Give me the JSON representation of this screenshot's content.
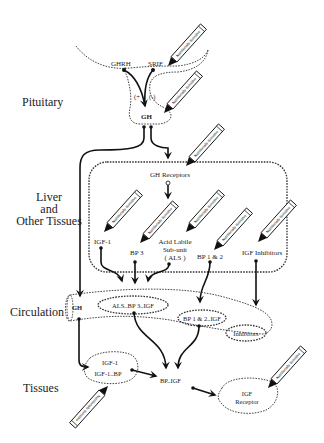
{
  "regions": {
    "pituitary": "Pituitary",
    "liver_1": "Liver",
    "liver_2": "and",
    "liver_3": "Other Tissues",
    "circulation": "Circulation",
    "tissues": "Tissues"
  },
  "pituitary": {
    "ghrh": "GHRH",
    "srif": "SRIF",
    "plus": "(+",
    "minus": "(-)",
    "gh": "GH"
  },
  "liver": {
    "gh_receptors": "GH Receptors",
    "igf1": "IGF-1",
    "bp3": "BP 3",
    "als_1": "Acid Labile",
    "als_2": "Sub-unit",
    "als_3": "( ALS )",
    "bp12": "BP 1 & 2",
    "igf_inhibitors": "IGF Inhibitors"
  },
  "circulation": {
    "gh": "GH",
    "als_bp3_igf": "ALS..BP 3..IGF",
    "bp12_igf": "BP 1 & 2..IGF",
    "inhibitors": "Inhibitors"
  },
  "tissues": {
    "igf1": "IGF-1",
    "igf1_bp": "IGF-1..BP",
    "bp_igf": "BP..IGF",
    "igf_receptor_1": "IGF",
    "igf_receptor_2": "Receptor"
  },
  "pencil_label": "Nutritionally Sensitive"
}
